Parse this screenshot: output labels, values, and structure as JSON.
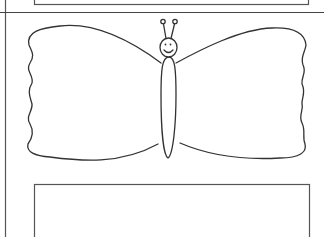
{
  "page": {
    "kind": "coloring-page",
    "colors": {
      "background": "#ffffff",
      "stroke": "#3a3a3a",
      "frame": "#555555"
    }
  },
  "elements": {
    "top_frame": "empty rectangle frame (top, cropped)",
    "butterfly": "smiling butterfly with antennae and scalloped wings",
    "bottom_frame": "empty rectangle frame (bottom, cropped)"
  }
}
